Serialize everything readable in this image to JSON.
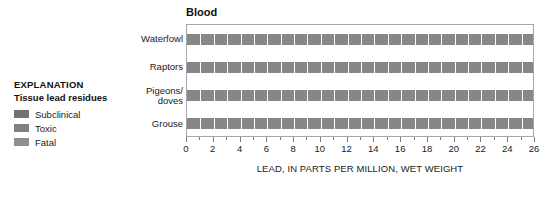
{
  "legend": {
    "title": "EXPLANATION",
    "subtitle": "Tissue lead residues",
    "items": [
      {
        "label": "Subclinical",
        "color": "#737373"
      },
      {
        "label": "Toxic",
        "color": "#828282"
      },
      {
        "label": "Fatal",
        "color": "#8f8f8f"
      }
    ]
  },
  "chart_data": {
    "type": "bar",
    "orientation": "horizontal",
    "title": "Blood",
    "xlabel": "LEAD, IN PARTS PER MILLION, WET WEIGHT",
    "ylabel": "",
    "categories": [
      "Waterfowl",
      "Raptors",
      "Pigeons/\ndoves",
      "Grouse"
    ],
    "values": [
      26,
      26,
      26,
      26
    ],
    "xlim": [
      0,
      26
    ],
    "xticks": [
      0,
      2,
      4,
      6,
      8,
      10,
      12,
      14,
      16,
      18,
      20,
      22,
      24,
      26
    ],
    "xtick_labels": [
      "0",
      "2",
      "4",
      "6",
      "8",
      "10",
      "12",
      "14",
      "16",
      "18",
      "20",
      "22",
      "24",
      "26"
    ],
    "xminorticks": [
      1,
      3,
      5,
      7,
      9,
      11,
      13,
      15,
      17,
      19,
      21,
      23,
      25
    ],
    "grid": false,
    "legend_position": "left-outside",
    "bar_color": "#878787",
    "series": [
      {
        "name": "Subclinical",
        "color": "#737373",
        "values": [
          26,
          26,
          26,
          26
        ]
      },
      {
        "name": "Toxic",
        "color": "#828282",
        "values": [
          26,
          26,
          26,
          26
        ]
      },
      {
        "name": "Fatal",
        "color": "#8f8f8f",
        "values": [
          26,
          26,
          26,
          26
        ]
      }
    ]
  }
}
